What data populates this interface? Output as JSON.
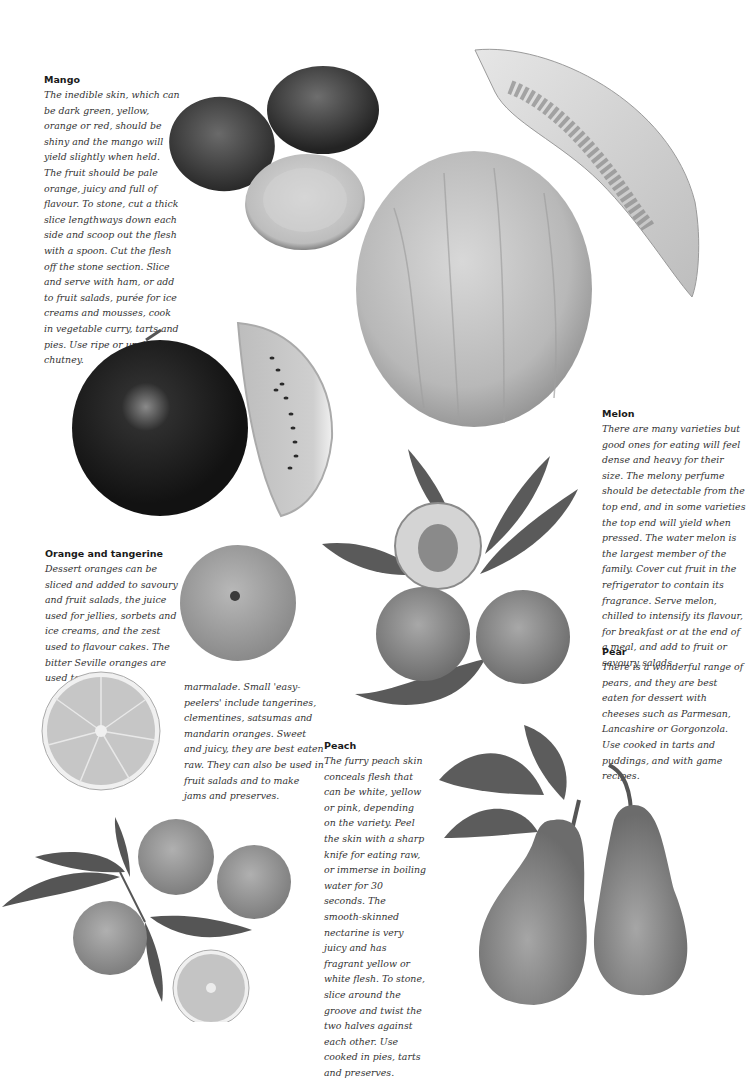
{
  "page": {
    "background": "#ffffff",
    "color_mode": "grayscale"
  },
  "sections": {
    "mango": {
      "heading": "Mango",
      "body": "The inedible skin, which can be dark green, yellow, orange or red, should be shiny and the mango will yield slightly when held. The fruit should be pale orange, juicy and full of flavour. To stone, cut a thick slice lengthways down each side and scoop out the flesh with a spoon. Cut the flesh off the stone section. Slice and serve with ham, or add to fruit salads, purée for ice creams and mousses, cook in vegetable curry, tarts and pies. Use ripe or unripe for chutney."
    },
    "orange": {
      "heading": "Orange and tangerine",
      "body_part1": "Dessert oranges can be sliced and added to savoury and fruit salads, the juice used for jellies, sorbets and ice creams, and the zest used to flavour cakes. The bitter Seville oranges are used to make",
      "body_part2": "marmalade. Small 'easy-peelers' include tangerines, clementines, satsumas and mandarin oranges. Sweet and juicy, they are best eaten raw. They can also be used in fruit salads and to make jams and preserves."
    },
    "peach": {
      "heading": "Peach",
      "body": "The furry peach skin conceals flesh that can be white, yellow or pink, depending on the variety. Peel the skin with a sharp knife for eating raw, or immerse in boiling water for 30 seconds. The smooth-skinned nectarine is very juicy and has fragrant yellow or white flesh. To stone, slice around the groove and twist the two halves against each other. Use cooked in pies, tarts and preserves."
    },
    "melon": {
      "heading": "Melon",
      "body": "There are many varieties but good ones for eating will feel dense and heavy for their size. The melony perfume should be detectable from the top end, and in some varieties the top end will yield when pressed. The water melon is the largest member of the family. Cover cut fruit in the refrigerator to contain its fragrance. Serve melon, chilled to intensify its flavour, for breakfast or at the end of a meal, and add to fruit or savoury salads."
    },
    "pear": {
      "heading": "Pear",
      "body": "There is a wonderful range of pears, and they are best eaten for dessert with cheeses such as Parmesan, Lancashire or Gorgonzola. Use cooked in tarts and puddings, and with game recipes."
    }
  },
  "images": [
    {
      "subject": "mangoes",
      "description": "two whole mangoes and a halved mango"
    },
    {
      "subject": "melon-slice",
      "description": "wedge of melon with seeds"
    },
    {
      "subject": "melon-whole",
      "description": "large whole melon"
    },
    {
      "subject": "watermelon",
      "description": "whole dark watermelon and a wedge"
    },
    {
      "subject": "peaches",
      "description": "peaches with leaves, one halved showing stone"
    },
    {
      "subject": "orange-whole",
      "description": "whole orange"
    },
    {
      "subject": "orange-half",
      "description": "halved orange cross-section"
    },
    {
      "subject": "tangerines",
      "description": "tangerines with leaves, one halved"
    },
    {
      "subject": "pears",
      "description": "two pears with leaves"
    }
  ]
}
